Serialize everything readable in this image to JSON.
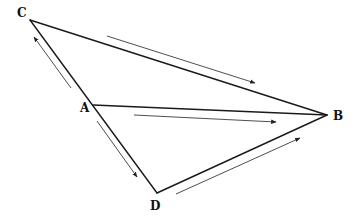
{
  "diagram": {
    "type": "directed-graph",
    "nodes": [
      {
        "id": "A",
        "label": "A",
        "x": 93,
        "y": 105,
        "label_x": 80,
        "label_y": 112
      },
      {
        "id": "B",
        "label": "B",
        "x": 327,
        "y": 115,
        "label_x": 333,
        "label_y": 120
      },
      {
        "id": "C",
        "label": "C",
        "x": 30,
        "y": 20,
        "label_x": 17,
        "label_y": 17
      },
      {
        "id": "D",
        "label": "D",
        "x": 157,
        "y": 193,
        "label_x": 150,
        "label_y": 210
      }
    ],
    "edges": [
      {
        "from": "C",
        "to": "B"
      },
      {
        "from": "A",
        "to": "B"
      },
      {
        "from": "D",
        "to": "B"
      },
      {
        "from": "C",
        "to": "D"
      }
    ],
    "flow_arrows": [
      {
        "name": "arrow-a-to-c",
        "from": "A",
        "to": "C",
        "x1": 71,
        "y1": 88,
        "x2": 34,
        "y2": 37
      },
      {
        "name": "arrow-a-to-d",
        "from": "A",
        "to": "D",
        "x1": 97,
        "y1": 121,
        "x2": 137,
        "y2": 177
      },
      {
        "name": "arrow-c-to-b",
        "from": "C",
        "to": "B",
        "x1": 107,
        "y1": 36,
        "x2": 255,
        "y2": 83
      },
      {
        "name": "arrow-a-to-b",
        "from": "A",
        "to": "B",
        "x1": 134,
        "y1": 115,
        "x2": 276,
        "y2": 122
      },
      {
        "name": "arrow-d-to-b",
        "from": "D",
        "to": "B",
        "x1": 176,
        "y1": 194,
        "x2": 300,
        "y2": 138
      }
    ],
    "colors": {
      "line": "#1a1a1a",
      "arrow": "#3a3a3a",
      "background": "#ffffff"
    }
  }
}
